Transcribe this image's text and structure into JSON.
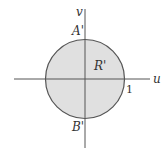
{
  "diagram": {
    "type": "region-in-uv-plane",
    "colors": {
      "region_fill": "#e0e0e0",
      "circle_stroke": "#555555",
      "axis_stroke": "#555555",
      "text": "#333333"
    },
    "axes": {
      "horizontal_label": "u",
      "vertical_label": "v"
    },
    "region": {
      "shape": "disk",
      "label": "R'",
      "center": [
        0,
        0
      ],
      "radius": 1
    },
    "points": [
      {
        "name": "A'",
        "label": "A'",
        "position": "top of circle on v-axis"
      },
      {
        "name": "B'",
        "label": "B'",
        "position": "bottom of circle on v-axis"
      }
    ],
    "tick_labels": {
      "u_one": "1"
    }
  }
}
